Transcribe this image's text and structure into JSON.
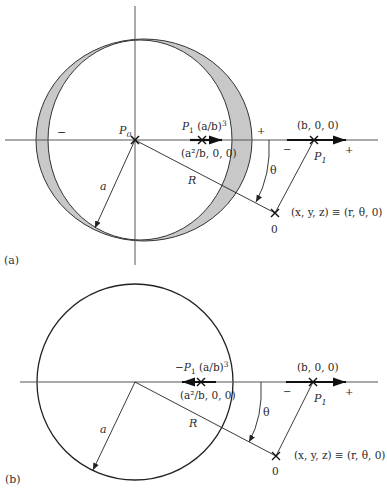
{
  "figure": {
    "panels": [
      {
        "id": "a",
        "caption": "(a)",
        "sign_left": "−",
        "sign_right": "+",
        "center_label": "P",
        "center_label_sub": "0",
        "image_dipole": {
          "label_prefix": "P",
          "label_sub": "1",
          "label_factor": "(a/b)",
          "label_exp": "3",
          "position": "(a²/b, 0, 0)",
          "direction": "right"
        },
        "dipole": {
          "position": "(b, 0, 0)",
          "label": "P",
          "label_sub": "1",
          "minus": "−",
          "plus": "+"
        },
        "radius_label": "a",
        "distance_label": "R",
        "angle_label": "θ",
        "field_point": "(x, y, z) ≡ (r, θ, 0)",
        "origin_label": "0",
        "charge_distribution": "shaded crescent"
      },
      {
        "id": "b",
        "caption": "(b)",
        "image_dipole": {
          "label_prefix": "−P",
          "label_sub": "1",
          "label_factor": "(a/b)",
          "label_exp": "3",
          "position": "(a²/b, 0, 0)",
          "direction": "left"
        },
        "dipole": {
          "position": "(b, 0, 0)",
          "label": "P",
          "label_sub": "1",
          "minus": "−",
          "plus": "+"
        },
        "radius_label": "a",
        "distance_label": "R",
        "angle_label": "θ",
        "field_point": "(x, y, z) ≡ (r, θ, 0)",
        "origin_label": "0"
      }
    ],
    "colors": {
      "line": "#2a2a2a",
      "axis": "#555555",
      "shade": "#c8c8c8"
    }
  }
}
